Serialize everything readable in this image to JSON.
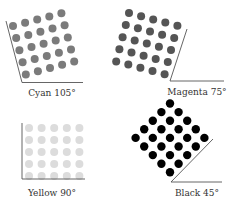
{
  "panels": [
    {
      "id": "cyan",
      "label": "Cyan 105°",
      "angle": 105,
      "dot_color": "#7b7b7b",
      "dot_radius": 4,
      "grid": {
        "rows": 5,
        "cols": 5,
        "origin": [
          13,
          26
        ],
        "col_step": [
          12.1,
          -3.2
        ],
        "row_step": [
          3.2,
          12.1
        ]
      },
      "axis": {
        "p1": [
          6,
          21
        ],
        "p2": [
          22,
          82.5
        ],
        "p3": [
          83,
          82.5
        ],
        "color": "#555"
      },
      "label_pos": [
        52,
        96
      ]
    },
    {
      "id": "magenta",
      "label": "Magenta 75°",
      "angle": 75,
      "dot_color": "#555555",
      "dot_radius": 4,
      "grid": {
        "rows": 5,
        "cols": 5,
        "origin": [
          129,
          13
        ],
        "col_step": [
          12.1,
          3.2
        ],
        "row_step": [
          -3.2,
          12.1
        ]
      },
      "axis": {
        "p1": [
          187,
          29
        ],
        "p2": [
          170,
          81
        ],
        "p3": [
          224,
          81
        ],
        "color": "#555"
      },
      "label_pos": [
        197,
        95
      ]
    },
    {
      "id": "yellow",
      "label": "Yellow 90°",
      "angle": 90,
      "dot_color": "#dcdcdc",
      "dot_radius": 4,
      "grid": {
        "rows": 5,
        "cols": 5,
        "origin": [
          29,
          128
        ],
        "col_step": [
          12.6,
          0
        ],
        "row_step": [
          0,
          12
        ]
      },
      "axis": {
        "p1": [
          22,
          123
        ],
        "p2": [
          22,
          179
        ],
        "p3": [
          85,
          179
        ],
        "color": "#555"
      },
      "label_pos": [
        52,
        196
      ]
    },
    {
      "id": "black",
      "label": "Black 45°",
      "angle": 45,
      "dot_color": "#000000",
      "dot_radius": 4.2,
      "grid": {
        "rows": 5,
        "cols": 5,
        "origin": [
          170,
          103.5
        ],
        "col_step": [
          8.6,
          8.6
        ],
        "row_step": [
          -8.6,
          8.6
        ]
      },
      "axis": {
        "p1": [
          213,
          139
        ],
        "p2": [
          171,
          182
        ],
        "p3": [
          222,
          182
        ],
        "color": "#555"
      },
      "label_pos": [
        197,
        196
      ]
    }
  ]
}
